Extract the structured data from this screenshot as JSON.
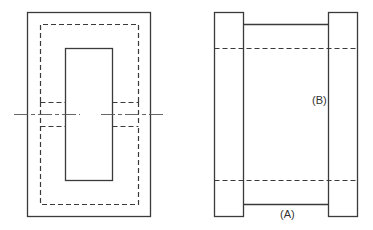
{
  "figure": {
    "left_view": {
      "name": "top view with centerline",
      "elements": [
        "outer-frame",
        "dashed-outline",
        "inner-window",
        "centerline",
        "dashed-stubs"
      ]
    },
    "right_view": {
      "name": "side view",
      "labels": {
        "a": "(A)",
        "b": "(B)"
      }
    },
    "colors": {
      "line": "#3a3a3a",
      "background": "#ffffff"
    }
  }
}
